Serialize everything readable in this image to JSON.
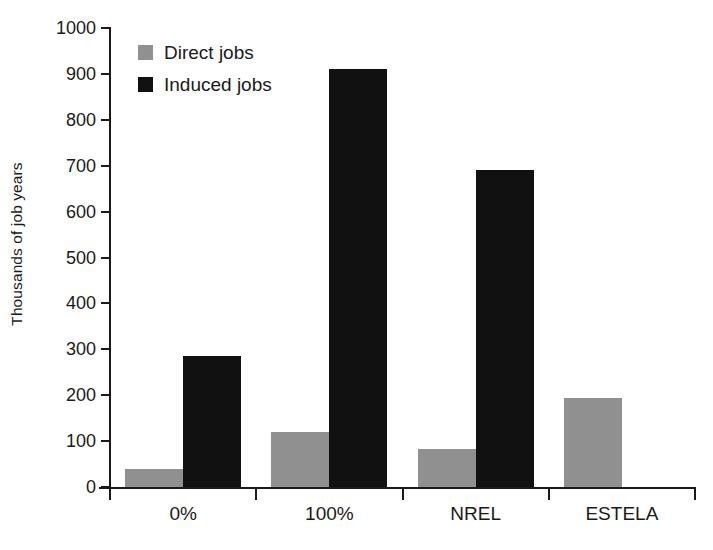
{
  "chart_data": {
    "type": "bar",
    "title": "",
    "subtitle": "",
    "xlabel": "",
    "ylabel": "Thousands of job years",
    "categories": [
      "0%",
      "100%",
      "NREL",
      "ESTELA"
    ],
    "series": [
      {
        "name": "Direct jobs",
        "color": "#909090",
        "values": [
          40,
          120,
          82,
          195
        ]
      },
      {
        "name": "Induced jobs",
        "color": "#111111",
        "values": [
          285,
          910,
          690,
          0
        ]
      }
    ],
    "ylim": [
      0,
      1000
    ],
    "ytick_step": 100,
    "yticks": [
      0,
      100,
      200,
      300,
      400,
      500,
      600,
      700,
      800,
      900,
      1000
    ],
    "ytick_labels": [
      "0",
      "100",
      "200",
      "300",
      "400",
      "500",
      "600",
      "700",
      "800",
      "900",
      "1000"
    ],
    "grid": false,
    "legend_position": "top-left",
    "legend_entries": [
      {
        "label": "Direct jobs",
        "color": "#909090"
      },
      {
        "label": "Induced jobs",
        "color": "#111111"
      }
    ],
    "axis_color": "#1a1a1a",
    "background_color": "#ffffff"
  }
}
